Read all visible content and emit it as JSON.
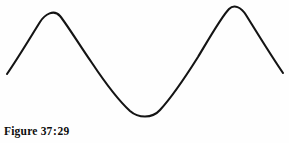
{
  "figure": {
    "caption_label": "Figure",
    "caption_number": "37",
    "caption_separator": ":",
    "caption_subnumber": "29",
    "caption_full": "Figure 37:29"
  },
  "style": {
    "stroke_color": "#141414",
    "stroke_width": 2.1,
    "background_color": "#fefefe",
    "caption_color": "#0d0d0d"
  },
  "chart_data": {
    "type": "line",
    "subtitle": "",
    "xlabel": "",
    "ylabel": "",
    "grid": false,
    "legend": false,
    "axes_visible": false,
    "tick_labels_x": [],
    "tick_labels_y": [],
    "xlim": [
      0,
      289
    ],
    "ylim": [
      143,
      0
    ],
    "series": [
      {
        "name": "sine-wave",
        "color": "#141414",
        "points": [
          [
            7,
            74
          ],
          [
            14,
            64
          ],
          [
            22,
            52
          ],
          [
            30,
            39
          ],
          [
            38,
            25
          ],
          [
            44,
            16
          ],
          [
            49,
            11
          ],
          [
            56,
            12
          ],
          [
            63,
            19
          ],
          [
            71,
            31
          ],
          [
            79,
            43
          ],
          [
            87,
            54
          ],
          [
            95,
            66
          ],
          [
            103,
            78
          ],
          [
            111,
            89
          ],
          [
            119,
            99
          ],
          [
            127,
            108
          ],
          [
            135,
            114
          ],
          [
            146,
            118
          ],
          [
            156,
            114
          ],
          [
            164,
            107
          ],
          [
            172,
            97
          ],
          [
            180,
            85
          ],
          [
            188,
            72
          ],
          [
            196,
            59
          ],
          [
            204,
            45
          ],
          [
            212,
            31
          ],
          [
            220,
            18
          ],
          [
            227,
            10
          ],
          [
            233,
            7
          ],
          [
            240,
            9
          ],
          [
            247,
            17
          ],
          [
            255,
            29
          ],
          [
            263,
            42
          ],
          [
            271,
            55
          ],
          [
            278,
            66
          ],
          [
            283,
            73
          ]
        ],
        "critical_points": [
          {
            "name": "left-endpoint",
            "x": 7,
            "y": 74
          },
          {
            "name": "first-crest",
            "x": 49,
            "y": 11
          },
          {
            "name": "descending-midpoint",
            "x": 95,
            "y": 66
          },
          {
            "name": "trough",
            "x": 146,
            "y": 118
          },
          {
            "name": "ascending-midpoint",
            "x": 190,
            "y": 68
          },
          {
            "name": "second-crest",
            "x": 233,
            "y": 7
          },
          {
            "name": "right-endpoint",
            "x": 283,
            "y": 73
          }
        ]
      }
    ],
    "path_d": "M 7 74 C 18 58 30 38 40 22 C 45 14 54 9 60 16 C 68 26 80 46 92 63 C 104 81 118 100 130 111 C 138 118 152 119 160 110 C 172 97 186 76 198 57 C 210 37 222 16 229 9 C 234 4 241 7 246 15 C 256 31 270 54 283 73"
  }
}
